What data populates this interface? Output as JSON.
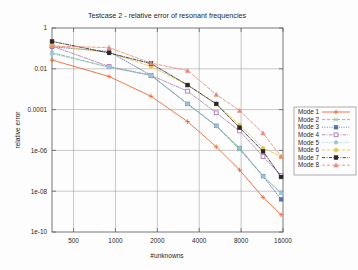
{
  "chart_data": {
    "type": "line",
    "title": "Testcase 2 - relative error of resonant frequencies",
    "xlabel": "#unknowns",
    "ylabel": "relative error",
    "xscale": "log2",
    "yscale": "log10",
    "xlim": [
      350,
      16000
    ],
    "ylim": [
      1e-10,
      1
    ],
    "grid": true,
    "legend_position": "right-outside",
    "xticks": [
      500,
      1000,
      2000,
      4000,
      8000,
      16000
    ],
    "xtick_labels": [
      "500",
      "1000",
      "2000",
      "4000",
      "8000",
      "16000"
    ],
    "yticks": [
      1,
      0.01,
      0.0001,
      1e-06,
      1e-08,
      1e-10
    ],
    "ytick_labels": [
      "1",
      "0.01",
      "0.0001",
      "1e-06",
      "1e-08",
      "1e-10"
    ],
    "x": [
      350,
      900,
      1800,
      3300,
      5300,
      7800,
      11500,
      15500
    ],
    "series": [
      {
        "name": "Mode 1",
        "color": "#e8622a",
        "dash": "none",
        "marker": "plus",
        "values": [
          0.027,
          0.0042,
          0.00045,
          2.6e-05,
          1.5e-06,
          1.1e-07,
          5e-09,
          7e-10
        ]
      },
      {
        "name": "Mode 2",
        "color": "#6fbf73",
        "dash": "dashed",
        "marker": "cross",
        "values": [
          0.062,
          0.012,
          0.0048,
          0.00019,
          1.6e-05,
          1.1e-06,
          5.5e-08,
          8e-09
        ]
      },
      {
        "name": "Mode 3",
        "color": "#5a6fae",
        "dash": "dotted",
        "marker": "filled-square",
        "values": [
          0.12,
          0.07,
          0.0048,
          0.00019,
          1.6e-05,
          1.3e-06,
          5.5e-08,
          4e-09
        ]
      },
      {
        "name": "Mode 4",
        "color": "#a978b4",
        "dash": "dashdot",
        "marker": "open-square",
        "values": [
          0.13,
          0.013,
          0.0048,
          0.0008,
          7e-05,
          9e-06,
          5e-07,
          6e-08
        ]
      },
      {
        "name": "Mode 5",
        "color": "#9bc4d8",
        "dash": "dotted",
        "marker": "filled-circle",
        "values": [
          0.055,
          0.012,
          0.0048,
          0.00019,
          1.6e-05,
          1.3e-06,
          5.5e-08,
          8e-09
        ]
      },
      {
        "name": "Mode 6",
        "color": "#e8c447",
        "dash": "dashed",
        "marker": "filled-circle",
        "values": [
          0.14,
          0.062,
          0.013,
          0.0016,
          0.00019,
          1.8e-05,
          1.3e-06,
          5e-07
        ]
      },
      {
        "name": "Mode 7",
        "color": "#262626",
        "dash": "dashdot",
        "marker": "filled-square",
        "values": [
          0.22,
          0.06,
          0.018,
          0.0016,
          0.00019,
          1.3e-05,
          9e-07,
          5e-08
        ]
      },
      {
        "name": "Mode 8",
        "color": "#e8897a",
        "dash": "dashed",
        "marker": "triangle",
        "values": [
          0.13,
          0.11,
          0.019,
          0.0082,
          0.00055,
          9e-05,
          7e-06,
          5e-07
        ]
      }
    ]
  },
  "legend": {
    "entries": [
      {
        "label": "Mode 1"
      },
      {
        "label": "Mode 2"
      },
      {
        "label": "Mode 3"
      },
      {
        "label": "Mode 4"
      },
      {
        "label": "Mode 5"
      },
      {
        "label": "Mode 6"
      },
      {
        "label": "Mode 7"
      },
      {
        "label": "Mode 8"
      }
    ]
  }
}
